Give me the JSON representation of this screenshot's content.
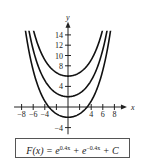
{
  "chart_data": {
    "type": "line",
    "title": "",
    "xlabel": "x",
    "ylabel": "y",
    "xlim": [
      -9,
      9
    ],
    "ylim": [
      -5,
      17
    ],
    "x_ticks": [
      -8,
      -6,
      -4,
      4,
      6,
      8
    ],
    "y_ticks": [
      -4,
      4,
      8,
      10,
      12,
      14
    ],
    "grid": false,
    "formula": "F(x) = e^(0.4x) + e^(-0.4x) + C",
    "series": [
      {
        "name": "C = 4",
        "C": 4,
        "minimum": [
          0,
          6
        ]
      },
      {
        "name": "C = 0",
        "C": 0,
        "minimum": [
          0,
          2
        ]
      },
      {
        "name": "C = -4",
        "C": -4,
        "minimum": [
          0,
          -2
        ]
      }
    ]
  },
  "labels": {
    "x_axis": "x",
    "y_axis": "y",
    "formula_lhs": "F(x) = e",
    "exp1": "0.4x",
    "mid": " + e",
    "exp2": "−0.4x",
    "rhs": " + C"
  }
}
